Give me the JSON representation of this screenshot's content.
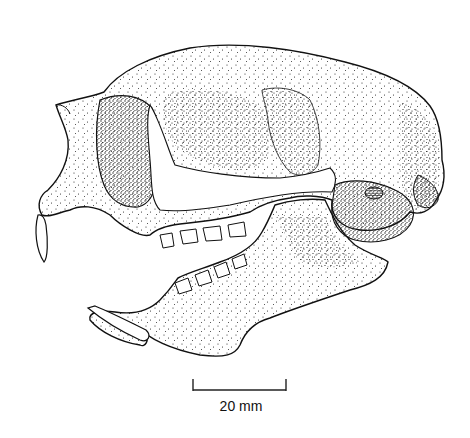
{
  "figure": {
    "scale_bar": {
      "label": "20 mm",
      "length_mm": 20
    },
    "colors": {
      "ink": "#111111",
      "paper": "#ffffff"
    }
  }
}
